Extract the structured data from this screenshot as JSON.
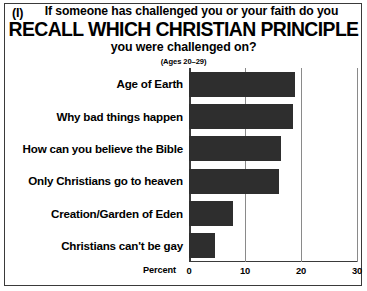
{
  "panel": {
    "label": "(I)"
  },
  "title": {
    "line1": "If someone has challenged you or your faith do you",
    "line2": "RECALL WHICH CHRISTIAN PRINCIPLE",
    "line3": "you were challenged on?",
    "subtitle": "(Ages 20–29)"
  },
  "chart_data": {
    "type": "bar",
    "orientation": "horizontal",
    "title": "If someone has challenged you or your faith do you RECALL WHICH CHRISTIAN PRINCIPLE you were challenged on?",
    "subtitle": "(Ages 20–29)",
    "categories": [
      "Age of Earth",
      "Why bad things happen",
      "How can you believe the Bible",
      "Only Christians go to heaven",
      "Creation/Garden of Eden",
      "Christians can't be gay"
    ],
    "values": [
      19,
      18.5,
      16.5,
      16,
      7.8,
      4.7
    ],
    "xlabel": "Percent",
    "ylabel": "",
    "xlim": [
      0,
      30
    ],
    "xticks": [
      0,
      10,
      20,
      30
    ],
    "xticklabels": [
      "0",
      "10",
      "20",
      "30"
    ],
    "grid": true,
    "legend": false,
    "bar_color": "#2e2e2e",
    "background_color": "#ffffff",
    "frame_color": "#3a3a3a"
  }
}
